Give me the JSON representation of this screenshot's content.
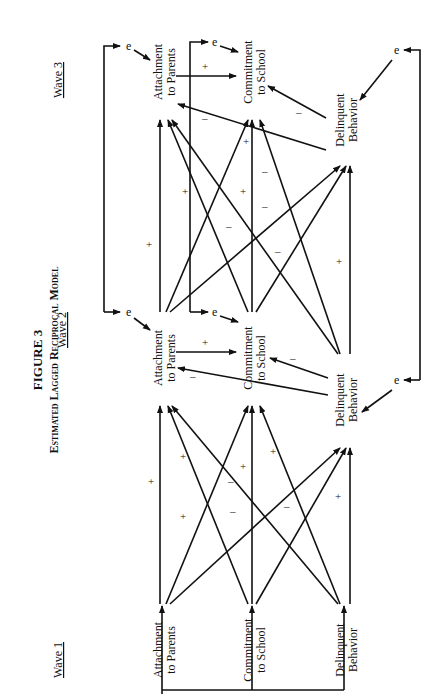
{
  "figure": {
    "number": "FIGURE 3",
    "title": "Estimated Lagged Reciprocal Model"
  },
  "waves": [
    {
      "label": "Wave 1"
    },
    {
      "label": "Wave 2"
    },
    {
      "label": "Wave 3"
    }
  ],
  "nodes": {
    "w1_att": {
      "line1": "Attachment",
      "line2": "to Parents"
    },
    "w1_com": {
      "line1": "Commitment",
      "line2": "to School"
    },
    "w1_del": {
      "line1": "Delinquent",
      "line2": "Behavior"
    },
    "w2_att": {
      "line1": "Attachment",
      "line2": "to Parents"
    },
    "w2_com": {
      "line1": "Commitment",
      "line2": "to School"
    },
    "w2_del": {
      "line1": "Delinquent",
      "line2": "Behavior"
    },
    "w3_att": {
      "line1": "Attachment",
      "line2": "to Parents"
    },
    "w3_com": {
      "line1": "Commitment",
      "line2": "to School"
    },
    "w3_del": {
      "line1": "Delinquent",
      "line2": "Behavior"
    }
  },
  "error_label": "e",
  "signs": {
    "plus": "+",
    "minus": "–"
  },
  "edges": [
    {
      "from": "w1_att",
      "to": "w2_att",
      "sign": "+"
    },
    {
      "from": "w1_com",
      "to": "w2_att",
      "sign": "+"
    },
    {
      "from": "w1_del",
      "to": "w2_att",
      "sign": "+"
    },
    {
      "from": "w1_att",
      "to": "w2_com",
      "sign": "+"
    },
    {
      "from": "w1_com",
      "to": "w2_com",
      "sign": "+"
    },
    {
      "from": "w1_del",
      "to": "w2_com",
      "sign": "–"
    },
    {
      "from": "w1_att",
      "to": "w2_del",
      "sign": "–"
    },
    {
      "from": "w1_com",
      "to": "w2_del",
      "sign": "–"
    },
    {
      "from": "w1_del",
      "to": "w2_del",
      "sign": "+"
    },
    {
      "from": "w2_att",
      "to": "w2_com",
      "sign": "+"
    },
    {
      "from": "w2_del",
      "to": "w2_com",
      "sign": "–"
    },
    {
      "from": "w2_del",
      "to": "w2_att",
      "sign": "–"
    },
    {
      "from": "w2_att",
      "to": "w3_att",
      "sign": "+"
    },
    {
      "from": "w2_com",
      "to": "w3_att",
      "sign": "+"
    },
    {
      "from": "w2_del",
      "to": "w3_att",
      "sign": "–"
    },
    {
      "from": "w2_att",
      "to": "w3_com",
      "sign": "+"
    },
    {
      "from": "w2_com",
      "to": "w3_com",
      "sign": "+"
    },
    {
      "from": "w2_del",
      "to": "w3_com",
      "sign": "–"
    },
    {
      "from": "w2_att",
      "to": "w3_del",
      "sign": "–"
    },
    {
      "from": "w2_com",
      "to": "w3_del",
      "sign": "–"
    },
    {
      "from": "w2_del",
      "to": "w3_del",
      "sign": "+"
    },
    {
      "from": "w3_att",
      "to": "w3_com",
      "sign": "+"
    },
    {
      "from": "w3_del",
      "to": "w3_com",
      "sign": "–"
    },
    {
      "from": "w3_del",
      "to": "w3_att",
      "sign": "–"
    }
  ]
}
